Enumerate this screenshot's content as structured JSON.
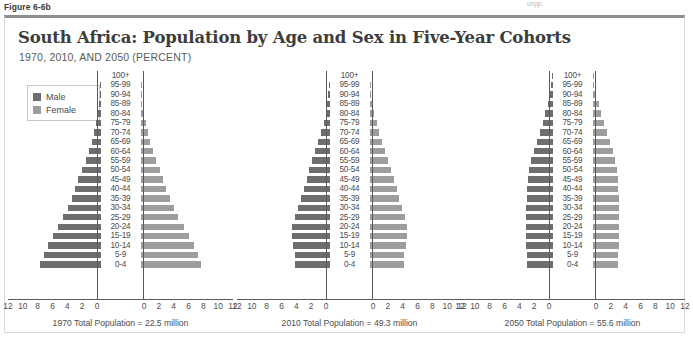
{
  "figure_label": "Figure 6-6b",
  "corner_note": "unpp.",
  "header": {
    "title": "South Africa: Population by Age and Sex in Five-Year Cohorts",
    "subtitle": "1970, 2010, AND 2050 (PERCENT)"
  },
  "legend": {
    "male_label": "Male",
    "female_label": "Female",
    "male_color": "#6e6e6e",
    "female_color": "#9d9d9d"
  },
  "chart_data": {
    "type": "bar",
    "subtype": "population-pyramid",
    "title": "South Africa: Population by Age and Sex in Five-Year Cohorts",
    "subtitle": "1970, 2010, AND 2050 (PERCENT)",
    "xlabel": "",
    "ylabel": "",
    "xlim": [
      0,
      12
    ],
    "grid": false,
    "legend_position": "top-left",
    "axis_ticks": [
      12,
      10,
      8,
      6,
      4,
      2,
      0
    ],
    "categories": [
      "100+",
      "95-99",
      "90-94",
      "85-89",
      "80-84",
      "75-79",
      "70-74",
      "65-69",
      "60-64",
      "55-59",
      "50-54",
      "45-49",
      "40-44",
      "35-39",
      "30-34",
      "25-29",
      "20-24",
      "15-19",
      "10-14",
      "5-9",
      "0-4"
    ],
    "panels": [
      {
        "year": "1970",
        "caption": "1970 Total Population = 22.5 million",
        "total_population": "22.5 million",
        "series": [
          {
            "name": "Male",
            "side": "left",
            "values": [
              0.0,
              0.05,
              0.1,
              0.2,
              0.35,
              0.6,
              0.9,
              1.2,
              1.6,
              2.0,
              2.5,
              3.0,
              3.4,
              3.9,
              4.4,
              5.0,
              5.7,
              6.4,
              7.1,
              7.6,
              8.1
            ]
          },
          {
            "name": "Female",
            "side": "right",
            "values": [
              0.0,
              0.05,
              0.12,
              0.25,
              0.4,
              0.7,
              1.0,
              1.3,
              1.7,
              2.1,
              2.6,
              3.1,
              3.5,
              4.0,
              4.5,
              5.1,
              5.8,
              6.5,
              7.2,
              7.7,
              8.1
            ]
          }
        ]
      },
      {
        "year": "2010",
        "caption": "2010 Total Population = 49.3 million",
        "total_population": "49.3 million",
        "series": [
          {
            "name": "Male",
            "side": "left",
            "values": [
              0.0,
              0.05,
              0.15,
              0.3,
              0.5,
              0.8,
              1.1,
              1.5,
              1.9,
              2.3,
              2.7,
              3.1,
              3.5,
              3.9,
              4.3,
              4.7,
              5.0,
              5.1,
              4.9,
              4.7,
              4.6
            ]
          },
          {
            "name": "Female",
            "side": "right",
            "values": [
              0.0,
              0.08,
              0.2,
              0.4,
              0.65,
              0.95,
              1.3,
              1.7,
              2.1,
              2.5,
              2.9,
              3.3,
              3.7,
              4.0,
              4.4,
              4.8,
              5.0,
              5.1,
              4.9,
              4.7,
              4.6
            ]
          }
        ]
      },
      {
        "year": "2050",
        "caption": "2050 Total Population = 55.6 million",
        "total_population": "55.6 million",
        "series": [
          {
            "name": "Male",
            "side": "left",
            "values": [
              0.05,
              0.15,
              0.35,
              0.6,
              0.95,
              1.3,
              1.7,
              2.1,
              2.5,
              2.9,
              3.2,
              3.3,
              3.4,
              3.5,
              3.6,
              3.6,
              3.6,
              3.6,
              3.6,
              3.5,
              3.5
            ]
          },
          {
            "name": "Female",
            "side": "right",
            "values": [
              0.08,
              0.25,
              0.5,
              0.85,
              1.2,
              1.6,
              2.0,
              2.4,
              2.7,
              3.0,
              3.3,
              3.4,
              3.5,
              3.6,
              3.6,
              3.6,
              3.6,
              3.6,
              3.6,
              3.5,
              3.5
            ]
          }
        ]
      }
    ]
  }
}
